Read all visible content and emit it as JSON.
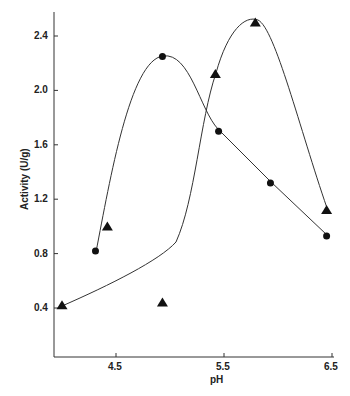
{
  "chart_data": {
    "type": "line",
    "title": "",
    "xlabel": "pH",
    "ylabel": "Activity (U/g)",
    "xlim": [
      3.95,
      6.5
    ],
    "ylim": [
      0,
      2.55
    ],
    "xticks": [
      "4.5",
      "5.5",
      "6.5"
    ],
    "yticks": [
      "0.4",
      "0.8",
      "1.2",
      "1.6",
      "2.0",
      "2.4"
    ],
    "grid": false,
    "legend": null,
    "series": [
      {
        "name": "circles",
        "marker": "circle",
        "x": [
          4.31,
          4.93,
          5.45,
          5.93,
          6.45
        ],
        "y": [
          0.82,
          2.25,
          1.7,
          1.32,
          0.93
        ]
      },
      {
        "name": "triangles",
        "marker": "triangle",
        "x": [
          4.0,
          4.42,
          4.93,
          5.42,
          5.79,
          6.45
        ],
        "y": [
          0.42,
          1.0,
          0.44,
          2.12,
          2.5,
          1.12
        ]
      }
    ]
  }
}
